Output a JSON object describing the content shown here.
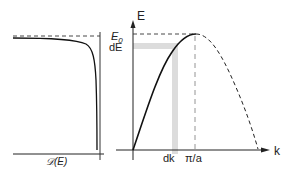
{
  "left_panel": {
    "x_axis_label": "𝒟(E)",
    "description": "Density of states D(E) diverging near E0"
  },
  "right_panel": {
    "y_axis_label": "E",
    "x_axis_label": "k",
    "e0_label": "E",
    "e0_subscript": "0",
    "de_label": "dE",
    "dk_label": "dk",
    "pi_a_label": "π/a"
  },
  "colors": {
    "curve": "#111111",
    "axis": "#222222",
    "band": "#d9d9d9",
    "dashed": "#333333"
  }
}
